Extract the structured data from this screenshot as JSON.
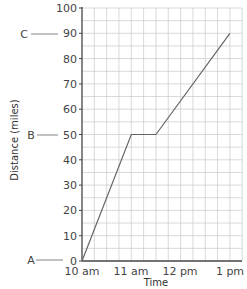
{
  "chart_data": {
    "type": "line",
    "title": "",
    "xlabel": "Time",
    "ylabel": "Distance (miles)",
    "x_ticks": [
      "10 am",
      "11 am",
      "12 pm",
      "1 pm"
    ],
    "y_ticks": [
      0,
      10,
      20,
      30,
      40,
      50,
      60,
      70,
      80,
      90,
      100
    ],
    "ylim": [
      0,
      100
    ],
    "xlim_hours": [
      10,
      13.25
    ],
    "grid": true,
    "series": [
      {
        "name": "Journey",
        "x_hours": [
          10,
          11,
          11.5,
          13
        ],
        "x": [
          "10 am",
          "11 am",
          "11:30 am",
          "1 pm"
        ],
        "values": [
          0,
          50,
          50,
          90
        ]
      }
    ],
    "annotations": [
      {
        "label": "A",
        "y": 0
      },
      {
        "label": "B",
        "y": 50
      },
      {
        "label": "C",
        "y": 90
      }
    ]
  },
  "labels": {
    "xlabel": "Time",
    "ylabel": "Distance (miles)",
    "x0": "10 am",
    "x1": "11 am",
    "x2": "12 pm",
    "x3": "1 pm",
    "ann_a": "A",
    "ann_b": "B",
    "ann_c": "C"
  },
  "colors": {
    "grid": "#c8c8c8",
    "axis": "#444444",
    "line": "#666666"
  }
}
